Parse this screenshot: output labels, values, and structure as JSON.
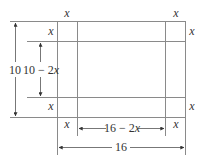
{
  "diagram": {
    "outer": {
      "width_label": "16",
      "height_label": "10"
    },
    "inner": {
      "width_label": "16 − 2x",
      "height_label": "10 − 2x"
    },
    "corner_labels": {
      "top_left_top": "x",
      "top_left_side": "x",
      "top_right_top": "x",
      "top_right_side": "x",
      "bottom_left_side": "x",
      "bottom_left_bottom": "x",
      "bottom_right_side": "x",
      "bottom_right_bottom": "x"
    },
    "colors": {
      "lines": "#8a8a8a",
      "arrows": "#555555",
      "text": "#333333"
    }
  }
}
